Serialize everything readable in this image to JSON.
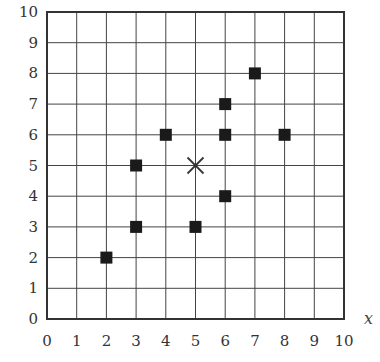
{
  "chart_data": {
    "type": "scatter",
    "title": "",
    "xlabel": "x",
    "ylabel": "",
    "xlim": [
      0,
      10
    ],
    "ylim": [
      0,
      10
    ],
    "grid": true,
    "legend": null,
    "x_ticks": [
      "0",
      "1",
      "2",
      "3",
      "4",
      "5",
      "6",
      "7",
      "8",
      "9",
      "10"
    ],
    "y_ticks": [
      "0",
      "1",
      "2",
      "3",
      "4",
      "5",
      "6",
      "7",
      "8",
      "9",
      "10"
    ],
    "series": [
      {
        "name": "points",
        "marker": "filled-square",
        "color": "#1a1a1a",
        "points": [
          {
            "x": 2,
            "y": 2
          },
          {
            "x": 3,
            "y": 3
          },
          {
            "x": 3,
            "y": 5
          },
          {
            "x": 4,
            "y": 6
          },
          {
            "x": 5,
            "y": 3
          },
          {
            "x": 6,
            "y": 4
          },
          {
            "x": 6,
            "y": 6
          },
          {
            "x": 6,
            "y": 7
          },
          {
            "x": 7,
            "y": 8
          },
          {
            "x": 8,
            "y": 6
          }
        ]
      },
      {
        "name": "center",
        "marker": "cross",
        "color": "#333333",
        "points": [
          {
            "x": 5,
            "y": 5
          }
        ]
      }
    ]
  }
}
